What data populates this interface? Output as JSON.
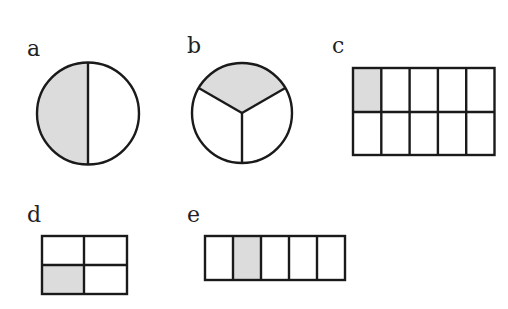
{
  "figure": {
    "shade_color": "#dcdcdc",
    "line_color": "#1a1a1a",
    "items": [
      {
        "label": "a",
        "shape": "circle",
        "parts": 2,
        "shaded": 1,
        "fraction": "1/2"
      },
      {
        "label": "b",
        "shape": "circle",
        "parts": 3,
        "shaded": 1,
        "fraction": "1/3"
      },
      {
        "label": "c",
        "shape": "rectangle-grid",
        "rows": 2,
        "cols": 5,
        "parts": 10,
        "shaded": 1,
        "shaded_cell": "row 1, col 1",
        "fraction": "1/10"
      },
      {
        "label": "d",
        "shape": "rectangle-grid",
        "rows": 2,
        "cols": 2,
        "parts": 4,
        "shaded": 1,
        "shaded_cell": "row 2, col 1",
        "fraction": "1/4"
      },
      {
        "label": "e",
        "shape": "rectangle-strip",
        "rows": 1,
        "cols": 5,
        "parts": 5,
        "shaded": 1,
        "shaded_cell": "col 2",
        "fraction": "1/5"
      }
    ]
  }
}
